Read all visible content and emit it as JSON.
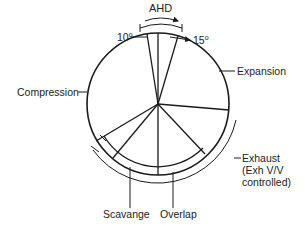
{
  "diagram": {
    "title_arrow_label": "AHD",
    "angle_left": "10",
    "angle_right": "15",
    "degree_symbol": "o",
    "labels": {
      "expansion": "Expansion",
      "compression": "Compression",
      "exhaust_line1": "Exhaust",
      "exhaust_line2": "(Exh V/V",
      "exhaust_line3": "controlled)",
      "scavange": "Scavange",
      "overlap": "Overlap"
    },
    "colors": {
      "stroke": "#1a1a1a",
      "background": "#ffffff"
    }
  }
}
